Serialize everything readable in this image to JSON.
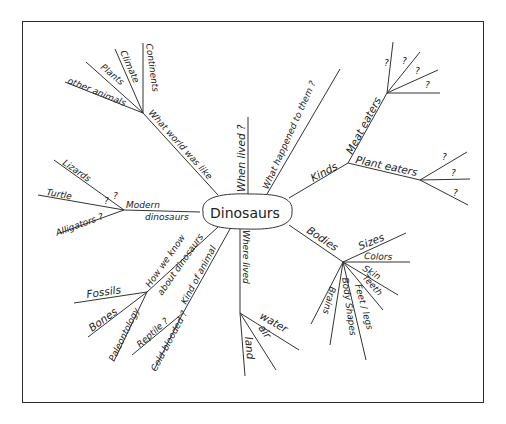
{
  "title": "Dinosaurs",
  "center": {
    "label": "Dinosaurs"
  },
  "branches": [
    {
      "label": "What world was like",
      "children": [
        "Continents",
        "Climate",
        "Plants",
        "other animals"
      ]
    },
    {
      "label": "When lived ?",
      "children": []
    },
    {
      "label": "What happened to them ?",
      "children": []
    },
    {
      "label": "Kinds",
      "children": [
        {
          "label": "Meat eaters",
          "children": [
            "?",
            "?",
            "?",
            "?"
          ]
        },
        {
          "label": "Plant eaters",
          "children": [
            "?",
            "?",
            "?"
          ]
        }
      ]
    },
    {
      "label": "Bodies",
      "children": [
        "Sizes",
        "Colors",
        "Skin",
        "Teeth",
        "Feet / legs",
        "Body Shapes",
        "Brains"
      ]
    },
    {
      "label": "Where lived",
      "children": [
        "water",
        "air",
        "land"
      ]
    },
    {
      "label": "Kind of animal",
      "children": [
        "Reptile ?",
        "Cold-blooded ?"
      ]
    },
    {
      "label": "How we know about dinosaurs",
      "children": [
        "Fossils",
        "Bones",
        "Paleontology"
      ]
    },
    {
      "label": "Modern dinosaurs",
      "children": [
        "Lizards ?",
        "Turtle ?",
        "Alligators ?"
      ]
    }
  ],
  "labels": {
    "center": "Dinosaurs",
    "what_world": "What world was like",
    "continents": "Continents",
    "climate": "Climate",
    "plants": "Plants",
    "other_animals": "other animals",
    "when_lived": "When lived ?",
    "what_happened": "What happened to them ?",
    "kinds": "Kinds",
    "meat_eaters": "Meat eaters",
    "plant_eaters": "Plant eaters",
    "q": "?",
    "bodies": "Bodies",
    "sizes": "Sizes",
    "colors": "Colors",
    "skin": "Skin",
    "teeth": "Teeth",
    "feet_legs": "Feet / legs",
    "body_shapes": "Body Shapes",
    "brains": "Brains",
    "where_lived": "Where lived",
    "water": "water",
    "air": "air",
    "land": "land",
    "kind_of_animal": "Kind of animal",
    "reptile": "Reptile ?",
    "cold_blooded": "Cold-blooded ?",
    "how_we_know_1": "How we know",
    "how_we_know_2": "about dinosaurs",
    "fossils": "Fossils",
    "bones": "Bones",
    "paleontology": "Paleontology",
    "modern_1": "Modern",
    "modern_2": "dinosaurs",
    "lizards": "Lizards",
    "turtle": "Turtle",
    "alligators": "Alligators ?"
  }
}
